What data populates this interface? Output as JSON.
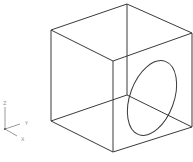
{
  "viewport": {
    "background": "#ffffff",
    "line_color": "#3a3a3a"
  },
  "cube": {
    "vertices": {
      "top_left": [
        51,
        30
      ],
      "top_back": [
        127,
        4
      ],
      "top_right": [
        192,
        33
      ],
      "top_front": [
        113,
        61
      ],
      "bottom_left": [
        51,
        121
      ],
      "bottom_back": [
        127,
        95
      ],
      "bottom_right": [
        192,
        127
      ],
      "bottom_front": [
        113,
        152
      ]
    }
  },
  "circle_on_right_face": {
    "cx": 152,
    "cy": 98,
    "rx": 22,
    "ry": 39,
    "rotation_deg": 20
  },
  "ucs_icon": {
    "axes": [
      {
        "label": "Z"
      },
      {
        "label": "Y"
      },
      {
        "label": "X"
      }
    ]
  }
}
